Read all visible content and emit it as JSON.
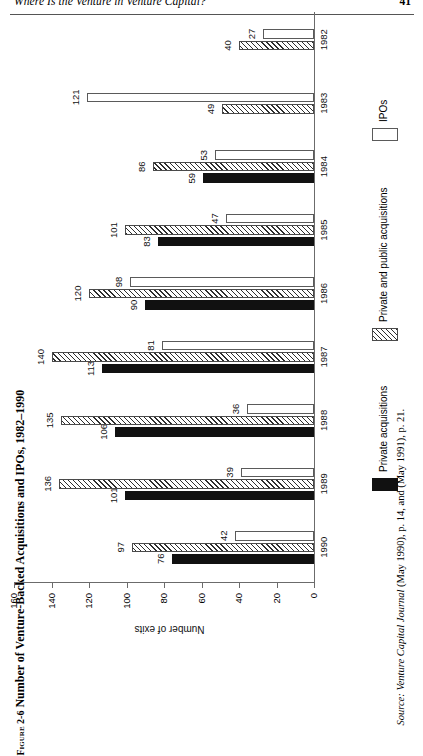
{
  "running_head": {
    "title": "Where Is the Venture in Venture Capital?",
    "page_number": "41"
  },
  "figure": {
    "label": "Figure 2-6",
    "caption": "Number of Venture-Backed Acquisitions and IPOs, 1982–1990",
    "full_title": "Figure 2-6 Number of Venture-Backed Acquisitions and IPOs, 1982–1990"
  },
  "source_note": {
    "prefix": "Source:",
    "italic_part": "Venture Capital Journal",
    "rest": "(May 1990), p. 14, and (May 1991), p. 21.",
    "full": "Source: Venture Capital Journal (May 1990), p. 14, and (May 1991), p. 21."
  },
  "legend": {
    "items": [
      {
        "label": "Private acquisitions",
        "swatch": "black",
        "color": "#111111"
      },
      {
        "label": "Private and public acquisitions",
        "swatch": "hatch",
        "color": "#2e2e2e"
      },
      {
        "label": "IPOs",
        "swatch": "white",
        "color": "#ffffff"
      }
    ]
  },
  "chart_data": {
    "type": "bar",
    "orientation": "horizontal",
    "title": "Number of Venture-Backed Acquisitions and IPOs, 1982–1990",
    "xlabel": "",
    "ylabel": "Number of exits",
    "ylim": [
      0,
      160
    ],
    "yticks": [
      0,
      20,
      40,
      60,
      80,
      100,
      120,
      140,
      160
    ],
    "ytick_labels": [
      "0",
      "20",
      "40",
      "60",
      "80",
      "100",
      "120",
      "140",
      "160"
    ],
    "grid": false,
    "legend_position": "bottom-right",
    "categories": [
      "1990",
      "1989",
      "1988",
      "1987",
      "1986",
      "1985",
      "1984",
      "1983",
      "1982"
    ],
    "series": [
      {
        "name": "Private acquisitions",
        "swatch": "black",
        "values": [
          76,
          101,
          106,
          113,
          90,
          83,
          59,
          null,
          null
        ]
      },
      {
        "name": "Private and public acquisitions",
        "swatch": "hatch",
        "values": [
          97,
          136,
          135,
          140,
          120,
          101,
          86,
          121,
          40
        ]
      },
      {
        "name": "IPOs",
        "swatch": "white",
        "values": [
          42,
          39,
          36,
          81,
          98,
          47,
          53,
          49,
          27
        ]
      }
    ],
    "groups": [
      {
        "year": "1990",
        "bars": [
          {
            "series": "Private acquisitions",
            "swatch": "black",
            "value": 76,
            "label": "76"
          },
          {
            "series": "Private and public acquisitions",
            "swatch": "hatch",
            "value": 97,
            "label": "97"
          },
          {
            "series": "IPOs",
            "swatch": "white",
            "value": 42,
            "label": "42"
          }
        ]
      },
      {
        "year": "1989",
        "bars": [
          {
            "series": "Private acquisitions",
            "swatch": "black",
            "value": 101,
            "label": "101"
          },
          {
            "series": "Private and public acquisitions",
            "swatch": "hatch",
            "value": 136,
            "label": "136"
          },
          {
            "series": "IPOs",
            "swatch": "white",
            "value": 39,
            "label": "39"
          }
        ]
      },
      {
        "year": "1988",
        "bars": [
          {
            "series": "Private acquisitions",
            "swatch": "black",
            "value": 106,
            "label": "106"
          },
          {
            "series": "Private and public acquisitions",
            "swatch": "hatch",
            "value": 135,
            "label": "135"
          },
          {
            "series": "IPOs",
            "swatch": "white",
            "value": 36,
            "label": "36"
          }
        ]
      },
      {
        "year": "1987",
        "bars": [
          {
            "series": "Private acquisitions",
            "swatch": "black",
            "value": 113,
            "label": "113"
          },
          {
            "series": "Private and public acquisitions",
            "swatch": "hatch",
            "value": 140,
            "label": "140"
          },
          {
            "series": "IPOs",
            "swatch": "white",
            "value": 81,
            "label": "81"
          }
        ]
      },
      {
        "year": "1986",
        "bars": [
          {
            "series": "Private acquisitions",
            "swatch": "black",
            "value": 90,
            "label": "90"
          },
          {
            "series": "Private and public acquisitions",
            "swatch": "hatch",
            "value": 120,
            "label": "120"
          },
          {
            "series": "IPOs",
            "swatch": "white",
            "value": 98,
            "label": "98"
          }
        ]
      },
      {
        "year": "1985",
        "bars": [
          {
            "series": "Private acquisitions",
            "swatch": "black",
            "value": 83,
            "label": "83"
          },
          {
            "series": "Private and public acquisitions",
            "swatch": "hatch",
            "value": 101,
            "label": "101"
          },
          {
            "series": "IPOs",
            "swatch": "white",
            "value": 47,
            "label": "47"
          }
        ]
      },
      {
        "year": "1984",
        "bars": [
          {
            "series": "Private acquisitions",
            "swatch": "black",
            "value": 59,
            "label": "59"
          },
          {
            "series": "Private and public acquisitions",
            "swatch": "hatch",
            "value": 86,
            "label": "86"
          },
          {
            "series": "IPOs",
            "swatch": "white",
            "value": 53,
            "label": "53"
          }
        ]
      },
      {
        "year": "1983",
        "bars": [
          {
            "series": "Private and public acquisitions",
            "swatch": "hatch",
            "value": 49,
            "label": "49"
          },
          {
            "series": "IPOs",
            "swatch": "white",
            "value": 121,
            "label": "121"
          }
        ]
      },
      {
        "year": "1982",
        "bars": [
          {
            "series": "Private and public acquisitions",
            "swatch": "hatch",
            "value": 40,
            "label": "40"
          },
          {
            "series": "IPOs",
            "swatch": "white",
            "value": 27,
            "label": "27"
          }
        ]
      }
    ]
  }
}
